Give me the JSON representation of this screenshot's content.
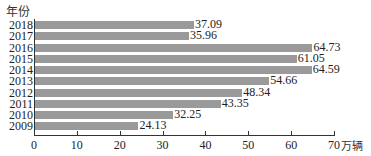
{
  "chart_data": {
    "type": "bar",
    "orientation": "horizontal",
    "title": "",
    "ylabel": "年份",
    "xlabel": "万辆",
    "categories": [
      "2018",
      "2017",
      "2016",
      "2015",
      "2014",
      "2013",
      "2012",
      "2011",
      "2010",
      "2009"
    ],
    "values": [
      37.09,
      35.96,
      64.73,
      61.05,
      64.59,
      54.66,
      48.34,
      43.35,
      32.25,
      24.13
    ],
    "value_labels": [
      "37.09",
      "35.96",
      "64.73",
      "61.05",
      "64.59",
      "54.66",
      "48.34",
      "43.35",
      "32.25",
      "24.13"
    ],
    "xlim": [
      0,
      70
    ],
    "xticks": [
      "0",
      "10",
      "20",
      "30",
      "40",
      "50",
      "60",
      "70"
    ],
    "grid": false,
    "legend": null,
    "bar_color": "#9a9a9a"
  }
}
